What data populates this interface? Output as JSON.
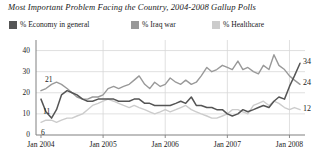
{
  "chart_data": {
    "type": "line",
    "title": "Most Important Problem Facing the Country, 2004-2008 Gallup Polls",
    "xlabel": "",
    "ylabel": "",
    "grid": true,
    "legend_position": "top",
    "ylim": [
      0,
      45
    ],
    "yticks": [
      "0",
      "10",
      "20",
      "30",
      "40"
    ],
    "ytick_values": [
      0,
      10,
      20,
      30,
      40
    ],
    "xticks": [
      "Jan 2004",
      "Jan 2005",
      "Jan 2006",
      "Jan 2007",
      "Jan 2008"
    ],
    "xtick_values": [
      2004.0,
      2005.0,
      2006.0,
      2007.0,
      2008.0
    ],
    "xlim": [
      2003.92,
      2008.25
    ],
    "colors": {
      "economy": "#555555",
      "iraq": "#999999",
      "healthcare": "#cccccc",
      "axis": "#808080",
      "grid": "#d8d8d8",
      "text": "#1a1a1a"
    },
    "start_labels": [
      {
        "series": "iraq",
        "text": "21",
        "x": 2004.0,
        "y": 21
      },
      {
        "series": "economy",
        "text": "11",
        "x": 2004.0,
        "y": 11
      },
      {
        "series": "healthcare",
        "text": "6",
        "x": 2004.0,
        "y": 6
      }
    ],
    "end_labels": [
      {
        "series": "economy",
        "text": "34",
        "x": 2008.17,
        "y": 34
      },
      {
        "series": "iraq",
        "text": "24",
        "x": 2008.17,
        "y": 24
      },
      {
        "series": "healthcare",
        "text": "12",
        "x": 2008.17,
        "y": 12
      }
    ],
    "series": [
      {
        "name": "% Economy in general",
        "key": "economy",
        "color": "#555555",
        "width": 1.5,
        "x": [
          2004.0,
          2004.08,
          2004.17,
          2004.25,
          2004.33,
          2004.42,
          2004.5,
          2004.58,
          2004.67,
          2004.75,
          2004.83,
          2004.92,
          2005.0,
          2005.08,
          2005.17,
          2005.25,
          2005.33,
          2005.42,
          2005.5,
          2005.58,
          2005.67,
          2005.75,
          2005.83,
          2005.92,
          2006.0,
          2006.08,
          2006.17,
          2006.25,
          2006.33,
          2006.42,
          2006.5,
          2006.58,
          2006.67,
          2006.75,
          2006.83,
          2006.92,
          2007.0,
          2007.08,
          2007.17,
          2007.25,
          2007.33,
          2007.42,
          2007.5,
          2007.58,
          2007.67,
          2007.75,
          2007.83,
          2007.92,
          2008.0,
          2008.08,
          2008.17
        ],
        "values": [
          17,
          11,
          8,
          12,
          19,
          21,
          20,
          19,
          17,
          16,
          16,
          17,
          17,
          17,
          17,
          16,
          16,
          16,
          17,
          17,
          15,
          15,
          14,
          14,
          14,
          14,
          15,
          16,
          15,
          18,
          14,
          14,
          13,
          13,
          12,
          12,
          10,
          9,
          10,
          12,
          11,
          12,
          13,
          14,
          13,
          16,
          18,
          17,
          23,
          28,
          34
        ]
      },
      {
        "name": "% Iraq war",
        "key": "iraq",
        "color": "#999999",
        "width": 1.4,
        "x": [
          2004.0,
          2004.08,
          2004.17,
          2004.25,
          2004.33,
          2004.42,
          2004.5,
          2004.58,
          2004.67,
          2004.75,
          2004.83,
          2004.92,
          2005.0,
          2005.08,
          2005.17,
          2005.25,
          2005.33,
          2005.42,
          2005.5,
          2005.58,
          2005.67,
          2005.75,
          2005.83,
          2005.92,
          2006.0,
          2006.08,
          2006.17,
          2006.25,
          2006.33,
          2006.42,
          2006.5,
          2006.58,
          2006.67,
          2006.75,
          2006.83,
          2006.92,
          2007.0,
          2007.08,
          2007.17,
          2007.25,
          2007.33,
          2007.42,
          2007.5,
          2007.58,
          2007.67,
          2007.75,
          2007.83,
          2007.92,
          2008.0,
          2008.08,
          2008.17
        ],
        "values": [
          21,
          22,
          24,
          25,
          24,
          22,
          20,
          18,
          17,
          17,
          18,
          18,
          19,
          22,
          23,
          22,
          23,
          24,
          26,
          28,
          24,
          22,
          25,
          23,
          24,
          27,
          25,
          24,
          26,
          24,
          25,
          28,
          32,
          30,
          31,
          33,
          32,
          31,
          35,
          31,
          32,
          30,
          29,
          33,
          31,
          38,
          33,
          31,
          28,
          26,
          24
        ]
      },
      {
        "name": "% Healthcare",
        "key": "healthcare",
        "color": "#cccccc",
        "width": 1.4,
        "x": [
          2004.0,
          2004.08,
          2004.17,
          2004.25,
          2004.33,
          2004.42,
          2004.5,
          2004.58,
          2004.67,
          2004.75,
          2004.83,
          2004.92,
          2005.0,
          2005.08,
          2005.17,
          2005.25,
          2005.33,
          2005.42,
          2005.5,
          2005.58,
          2005.67,
          2005.75,
          2005.83,
          2005.92,
          2006.0,
          2006.08,
          2006.17,
          2006.25,
          2006.33,
          2006.42,
          2006.5,
          2006.58,
          2006.67,
          2006.75,
          2006.83,
          2006.92,
          2007.0,
          2007.08,
          2007.17,
          2007.25,
          2007.33,
          2007.42,
          2007.5,
          2007.58,
          2007.67,
          2007.75,
          2007.83,
          2007.92,
          2008.0,
          2008.08,
          2008.17
        ],
        "values": [
          6,
          7,
          7,
          6,
          7,
          8,
          8,
          9,
          10,
          12,
          14,
          15,
          16,
          17,
          16,
          15,
          14,
          13,
          14,
          13,
          12,
          11,
          10,
          11,
          12,
          11,
          12,
          13,
          14,
          12,
          11,
          10,
          9,
          8,
          8,
          9,
          10,
          12,
          12,
          11,
          10,
          14,
          15,
          16,
          14,
          16,
          15,
          13,
          12,
          13,
          12
        ]
      }
    ]
  }
}
